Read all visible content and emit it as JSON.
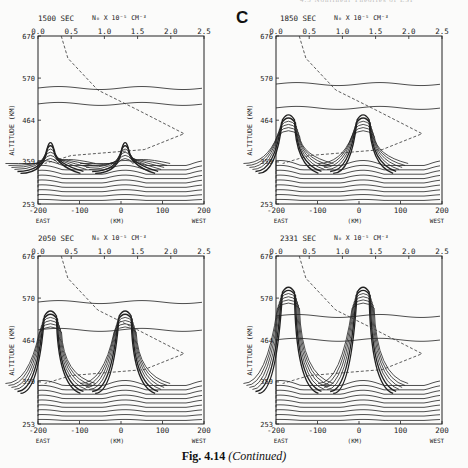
{
  "page": {
    "running_head": "4.5  Nonlinear Theories of ESF",
    "panel_letter": "C",
    "caption_main": "Fig. 4.14",
    "caption_suffix": "(Continued)"
  },
  "axes": {
    "y_label": "ALTITUDE (KM)",
    "y_ticks": [
      "676",
      "570",
      "464",
      "359",
      "253"
    ],
    "x_ticks": [
      "-200",
      "-100",
      "0",
      "100",
      "200"
    ],
    "x_left": "EAST",
    "x_mid": "(KM)",
    "x_right": "WEST",
    "top_label": "N₀ X 10⁻⁵ CM⁻³",
    "top_ticks": [
      "0.0",
      "0.5",
      "1.0",
      "1.5",
      "2.0",
      "2.5"
    ]
  },
  "panels": [
    {
      "time": "1500 SEC"
    },
    {
      "time": "1850 SEC"
    },
    {
      "time": "2050 SEC"
    },
    {
      "time": "2331 SEC"
    }
  ],
  "chart_data": [
    {
      "type": "line",
      "title": "1500 SEC",
      "xlabel": "(KM)  EAST → WEST",
      "ylabel": "ALTITUDE (KM)",
      "xlim": [
        -200,
        200
      ],
      "ylim": [
        253,
        676
      ],
      "top_axis": {
        "label": "N0 x 10^-5 cm^-3",
        "range": [
          0.0,
          2.5
        ]
      },
      "description": "Iso-density contours; dashed line = background density profile N0(altitude), peak ~2.2 at ~430 km. Two plume bumps rising near x=-170 km and x=+20 km to ~410 km.",
      "series": [
        {
          "name": "N0 profile (dashed)",
          "points": [
            [
              0.35,
              676
            ],
            [
              0.45,
              620
            ],
            [
              0.9,
              540
            ],
            [
              1.5,
              490
            ],
            [
              2.2,
              430
            ],
            [
              1.6,
              390
            ],
            [
              0.5,
              375
            ],
            [
              0.1,
              355
            ]
          ]
        }
      ]
    },
    {
      "type": "line",
      "title": "1850 SEC",
      "xlim": [
        -200,
        200
      ],
      "ylim": [
        253,
        676
      ],
      "description": "Plumes developing into hooked structures near x=-170 and x=+10 km reaching ~480 km.",
      "series": [
        {
          "name": "N0 profile (dashed)",
          "points": [
            [
              0.35,
              676
            ],
            [
              0.45,
              620
            ],
            [
              0.9,
              540
            ],
            [
              1.5,
              490
            ],
            [
              2.2,
              430
            ],
            [
              1.6,
              390
            ],
            [
              0.5,
              375
            ],
            [
              0.1,
              355
            ]
          ]
        }
      ]
    },
    {
      "type": "line",
      "title": "2050 SEC",
      "xlim": [
        -200,
        200
      ],
      "ylim": [
        253,
        676
      ],
      "description": "Plumes reaching ~540 km with bifurcated heads near x=-170 and x=0 km.",
      "series": [
        {
          "name": "N0 profile (dashed)",
          "points": [
            [
              0.35,
              676
            ],
            [
              0.45,
              620
            ],
            [
              0.9,
              540
            ],
            [
              1.5,
              490
            ],
            [
              2.2,
              430
            ],
            [
              1.6,
              390
            ],
            [
              0.5,
              375
            ],
            [
              0.1,
              355
            ]
          ]
        }
      ]
    },
    {
      "type": "line",
      "title": "2331 SEC",
      "xlim": [
        -200,
        200
      ],
      "ylim": [
        253,
        676
      ],
      "description": "Plumes reaching ~600 km with mushroom heads near x=-170 and x=+10 km.",
      "series": [
        {
          "name": "N0 profile (dashed)",
          "points": [
            [
              0.35,
              676
            ],
            [
              0.45,
              620
            ],
            [
              0.9,
              540
            ],
            [
              1.5,
              490
            ],
            [
              2.2,
              430
            ],
            [
              1.6,
              390
            ],
            [
              0.5,
              375
            ],
            [
              0.1,
              355
            ]
          ]
        }
      ]
    }
  ]
}
